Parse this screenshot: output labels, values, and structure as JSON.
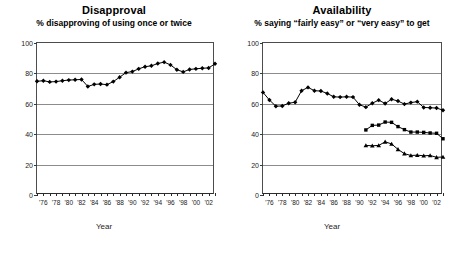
{
  "figure": {
    "width": 457,
    "height": 258,
    "background": "#ffffff",
    "ink_color": "#000000",
    "gridline_color": "#8c8c8c",
    "axis_color": "#2b2b2b"
  },
  "panels": [
    {
      "id": "disapproval",
      "title": "Disapproval",
      "subtitle": "% disapproving of using once or twice",
      "xlabel": "Year"
    },
    {
      "id": "availability",
      "title": "Availability",
      "subtitle": "% saying “fairly easy” or “very easy” to get",
      "xlabel": "Year"
    }
  ],
  "axes": {
    "y_ticks": [
      0,
      20,
      40,
      60,
      80,
      100
    ],
    "y_tick_labels": [
      "0",
      "20",
      "40",
      "60",
      "80",
      "100"
    ],
    "ylim": [
      0,
      100
    ],
    "x_tick_labels": [
      "'76",
      "'78",
      "'80",
      "'82",
      "'84",
      "'86",
      "'88",
      "'90",
      "'92",
      "'94",
      "'96",
      "'98",
      "'00",
      "'02"
    ],
    "x_tick_years": [
      1976,
      1978,
      1980,
      1982,
      1984,
      1986,
      1988,
      1990,
      1992,
      1994,
      1996,
      1998,
      2000,
      2002
    ],
    "xlim": [
      1975,
      2003
    ],
    "grid": "horizontal-only"
  },
  "chart_data": [
    {
      "type": "line",
      "title": "Disapproval",
      "subtitle": "% disapproving of using once or twice",
      "xlabel": "Year",
      "ylabel": "",
      "ylim": [
        0,
        100
      ],
      "xlim": [
        1975,
        2003
      ],
      "grid": true,
      "legend": "none",
      "x": [
        1975,
        1976,
        1977,
        1978,
        1979,
        1980,
        1981,
        1982,
        1983,
        1984,
        1985,
        1986,
        1987,
        1988,
        1989,
        1990,
        1991,
        1992,
        1993,
        1994,
        1995,
        1996,
        1997,
        1998,
        1999,
        2000,
        2001,
        2002,
        2003
      ],
      "series": [
        {
          "name": "12th graders",
          "marker": "diamond",
          "values": [
            74.8,
            75.2,
            74.4,
            74.6,
            75.2,
            75.6,
            75.8,
            76.0,
            71.4,
            72.8,
            73.0,
            72.6,
            74.6,
            77.5,
            80.5,
            81.2,
            83.0,
            84.4,
            85.0,
            86.5,
            87.4,
            85.6,
            82.4,
            81.0,
            82.6,
            83.0,
            83.4,
            83.6,
            86.3
          ]
        }
      ]
    },
    {
      "type": "line",
      "title": "Availability",
      "subtitle": "% saying “fairly easy” or “very easy” to get",
      "xlabel": "Year",
      "ylabel": "",
      "ylim": [
        0,
        100
      ],
      "xlim": [
        1975,
        2003
      ],
      "grid": true,
      "legend": "none",
      "series": [
        {
          "name": "12th graders",
          "marker": "diamond",
          "x": [
            1975,
            1976,
            1977,
            1978,
            1979,
            1980,
            1981,
            1982,
            1983,
            1984,
            1985,
            1986,
            1987,
            1988,
            1989,
            1990,
            1991,
            1992,
            1993,
            1994,
            1995,
            1996,
            1997,
            1998,
            1999,
            2000,
            2001,
            2002,
            2003
          ],
          "values": [
            67.5,
            62.5,
            58.4,
            58.6,
            60.4,
            61.0,
            68.6,
            70.8,
            68.6,
            68.4,
            66.8,
            64.6,
            64.4,
            64.6,
            64.4,
            59.4,
            57.8,
            60.4,
            62.4,
            60.2,
            63.0,
            61.8,
            59.8,
            60.8,
            61.4,
            57.6,
            57.4,
            57.2,
            55.8
          ]
        },
        {
          "name": "10th graders",
          "marker": "square",
          "x": [
            1991,
            1992,
            1993,
            1994,
            1995,
            1996,
            1997,
            1998,
            1999,
            2000,
            2001,
            2002,
            2003
          ],
          "values": [
            42.8,
            45.8,
            46.0,
            48.0,
            47.8,
            45.0,
            43.0,
            41.4,
            41.4,
            41.2,
            40.8,
            40.6,
            37.0
          ]
        },
        {
          "name": "8th graders",
          "marker": "triangle",
          "x": [
            1991,
            1992,
            1993,
            1994,
            1995,
            1996,
            1997,
            1998,
            1999,
            2000,
            2001,
            2002,
            2003
          ],
          "values": [
            32.6,
            32.4,
            32.6,
            35.0,
            33.6,
            30.0,
            27.2,
            26.0,
            26.2,
            25.8,
            26.0,
            24.8,
            25.0
          ]
        }
      ]
    }
  ]
}
